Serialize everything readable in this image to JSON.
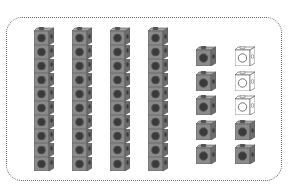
{
  "diagram": {
    "type": "base-ten-blocks",
    "colors": {
      "cube_front": "#8a8a8a",
      "cube_side": "#6e6e6e",
      "cube_top": "#a8a8a8",
      "cube_hole": "#3a3a3a",
      "cube_outline": "#555555",
      "empty_fill": "#ffffff",
      "frame_border": "#666666"
    },
    "rods": [
      {
        "x": 34,
        "cubes": 10
      },
      {
        "x": 72,
        "cubes": 10
      },
      {
        "x": 110,
        "cubes": 10
      },
      {
        "x": 148,
        "cubes": 10
      }
    ],
    "unit_columns": [
      {
        "x": 196,
        "cubes": [
          "filled",
          "filled",
          "filled",
          "filled",
          "filled"
        ]
      },
      {
        "x": 235,
        "cubes": [
          "empty",
          "empty",
          "empty",
          "filled",
          "filled"
        ]
      }
    ],
    "summary": {
      "tens": 4,
      "filled_units": 7,
      "empty_units": 3
    }
  }
}
